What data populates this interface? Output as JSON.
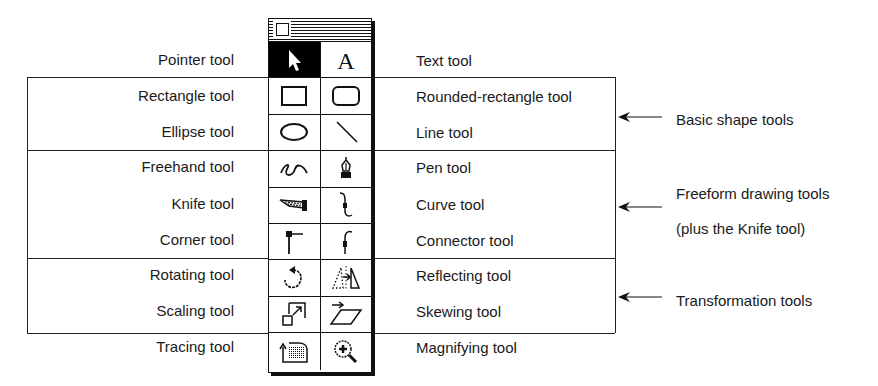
{
  "palette": {
    "title": "Toolbox",
    "rows": [
      {
        "left": {
          "icon": "pointer-icon",
          "selected": true
        },
        "right": {
          "icon": "text-icon",
          "glyph": "A"
        }
      },
      {
        "left": {
          "icon": "rectangle-icon"
        },
        "right": {
          "icon": "rounded-rectangle-icon"
        }
      },
      {
        "left": {
          "icon": "ellipse-icon"
        },
        "right": {
          "icon": "line-icon"
        }
      },
      {
        "left": {
          "icon": "freehand-icon"
        },
        "right": {
          "icon": "pen-icon"
        }
      },
      {
        "left": {
          "icon": "knife-icon"
        },
        "right": {
          "icon": "curve-icon"
        }
      },
      {
        "left": {
          "icon": "corner-icon"
        },
        "right": {
          "icon": "connector-icon"
        }
      },
      {
        "left": {
          "icon": "rotating-icon"
        },
        "right": {
          "icon": "reflecting-icon"
        }
      },
      {
        "left": {
          "icon": "scaling-icon"
        },
        "right": {
          "icon": "skewing-icon"
        }
      },
      {
        "left": {
          "icon": "tracing-icon"
        },
        "right": {
          "icon": "magnifying-icon"
        }
      }
    ]
  },
  "labels": {
    "left": [
      "Pointer tool",
      "Rectangle tool",
      "Ellipse tool",
      "Freehand tool",
      "Knife tool",
      "Corner tool",
      "Rotating tool",
      "Scaling tool",
      "Tracing tool"
    ],
    "right": [
      "Text tool",
      "Rounded-rectangle tool",
      "Line tool",
      "Pen tool",
      "Curve tool",
      "Connector tool",
      "Reflecting tool",
      "Skewing tool",
      "Magnifying tool"
    ]
  },
  "groups": [
    {
      "label": "Basic shape tools"
    },
    {
      "label": "Freeform drawing tools",
      "sublabel": "(plus the Knife tool)"
    },
    {
      "label": "Transformation tools"
    }
  ]
}
